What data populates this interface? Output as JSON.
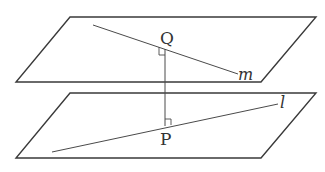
{
  "diagram": {
    "type": "geometry-two-parallel-planes",
    "colors": {
      "stroke": "#3a3a3a",
      "text": "#333333",
      "background": "#ffffff"
    },
    "planes": [
      {
        "id": "upper-plane",
        "points": "70,17 316,17 261,82 16,82"
      },
      {
        "id": "lower-plane",
        "points": "70,93 316,93 261,158 16,158"
      }
    ],
    "lines": {
      "m": {
        "label": "m",
        "x1": 93,
        "y1": 25,
        "x2": 238,
        "y2": 74,
        "label_x": 238,
        "label_y": 80
      },
      "l": {
        "label": "l",
        "x1": 52,
        "y1": 152,
        "x2": 278,
        "y2": 104,
        "label_x": 280,
        "label_y": 108
      }
    },
    "points": {
      "Q": {
        "label": "Q",
        "x": 165,
        "y": 49,
        "label_x": 160,
        "label_y": 44
      },
      "P": {
        "label": "P",
        "x": 165,
        "y": 126,
        "label_x": 160,
        "label_y": 145
      }
    },
    "perpendicular": {
      "from": "Q",
      "to": "P"
    }
  }
}
